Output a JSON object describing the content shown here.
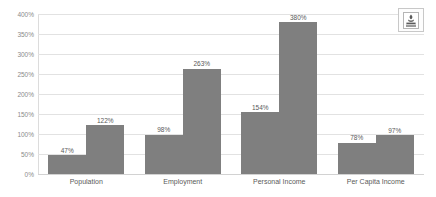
{
  "chart_data": {
    "type": "bar",
    "title": "",
    "subtitle": "",
    "xlabel": "",
    "ylabel": "",
    "categories": [
      "Population",
      "Employment",
      "Personal Income",
      "Per Capita Income"
    ],
    "series": [
      {
        "name": "series-1",
        "values": [
          47,
          98,
          154,
          78
        ]
      },
      {
        "name": "series-2",
        "values": [
          122,
          263,
          380,
          97
        ]
      }
    ],
    "value_labels": [
      [
        "47%",
        "122%"
      ],
      [
        "98%",
        "263%"
      ],
      [
        "154%",
        "380%"
      ],
      [
        "78%",
        "97%"
      ]
    ],
    "ylim": [
      0,
      400
    ],
    "ytick_values": [
      0,
      50,
      100,
      150,
      200,
      250,
      300,
      350,
      400
    ],
    "ytick_labels": [
      "0%",
      "50%",
      "100%",
      "150%",
      "200%",
      "250%",
      "300%",
      "350%",
      "400%"
    ],
    "grid": true,
    "legend": false,
    "legend_position": "none",
    "bar_color": "#7f7f7f",
    "gridline_color": "#e2e2e2",
    "axis_label_color": "#8a8a8a",
    "background_color": "#ffffff"
  },
  "logo": {
    "name": "agency-emblem-logo",
    "alt": ""
  }
}
